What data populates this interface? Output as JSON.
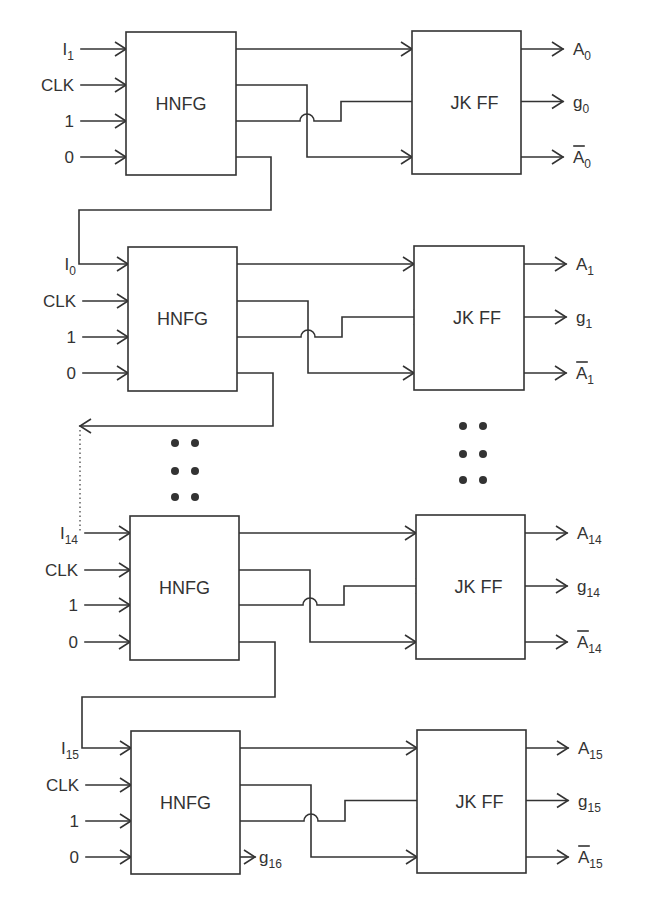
{
  "diagram": {
    "type": "block-diagram",
    "colors": {
      "line": "#333333",
      "text": "#333333",
      "background": "#ffffff"
    },
    "stages": [
      {
        "id": "stage-0",
        "hnfg": {
          "label": "HNFG",
          "x": 126,
          "y": 32,
          "w": 110,
          "h": 143
        },
        "jkff": {
          "label": "JK FF",
          "x": 412,
          "y": 31,
          "w": 109,
          "h": 143
        },
        "rows": [
          49,
          85,
          121,
          157
        ],
        "inputs": [
          {
            "main": "I",
            "sub": "1"
          },
          {
            "main": "CLK",
            "sub": ""
          },
          {
            "main": "1",
            "sub": ""
          },
          {
            "main": "0",
            "sub": ""
          }
        ],
        "outputs": [
          {
            "main": "A",
            "sub": "0",
            "bar": false
          },
          {
            "main": "g",
            "sub": "0",
            "bar": false
          },
          {
            "main": "A",
            "sub": "0",
            "bar": true
          }
        ],
        "first_input_wired": false,
        "fourth_output": "feedback"
      },
      {
        "id": "stage-1",
        "hnfg": {
          "label": "HNFG",
          "x": 128,
          "y": 247,
          "w": 109,
          "h": 144
        },
        "jkff": {
          "label": "JK FF",
          "x": 414,
          "y": 246,
          "w": 110,
          "h": 144
        },
        "rows": [
          264,
          301,
          337,
          373
        ],
        "inputs": [
          {
            "main": "I",
            "sub": "0"
          },
          {
            "main": "CLK",
            "sub": ""
          },
          {
            "main": "1",
            "sub": ""
          },
          {
            "main": "0",
            "sub": ""
          }
        ],
        "outputs": [
          {
            "main": "A",
            "sub": "1",
            "bar": false
          },
          {
            "main": "g",
            "sub": "1",
            "bar": false
          },
          {
            "main": "A",
            "sub": "1",
            "bar": true
          }
        ],
        "first_input_wired": true,
        "fourth_output": "feedback-arrow"
      },
      {
        "id": "stage-14",
        "hnfg": {
          "label": "HNFG",
          "x": 130,
          "y": 516,
          "w": 109,
          "h": 144
        },
        "jkff": {
          "label": "JK FF",
          "x": 416,
          "y": 515,
          "w": 109,
          "h": 144
        },
        "rows": [
          533,
          570,
          605,
          642
        ],
        "inputs": [
          {
            "main": "I",
            "sub": "14"
          },
          {
            "main": "CLK",
            "sub": ""
          },
          {
            "main": "1",
            "sub": ""
          },
          {
            "main": "0",
            "sub": ""
          }
        ],
        "outputs": [
          {
            "main": "A",
            "sub": "14",
            "bar": false
          },
          {
            "main": "g",
            "sub": "14",
            "bar": false
          },
          {
            "main": "A",
            "sub": "14",
            "bar": true
          }
        ],
        "first_input_wired": false,
        "fourth_output": "feedback"
      },
      {
        "id": "stage-15",
        "hnfg": {
          "label": "HNFG",
          "x": 131,
          "y": 731,
          "w": 109,
          "h": 143
        },
        "jkff": {
          "label": "JK FF",
          "x": 417,
          "y": 730,
          "w": 109,
          "h": 143
        },
        "rows": [
          748,
          785,
          821,
          857
        ],
        "inputs": [
          {
            "main": "I",
            "sub": "15"
          },
          {
            "main": "CLK",
            "sub": ""
          },
          {
            "main": "1",
            "sub": ""
          },
          {
            "main": "0",
            "sub": ""
          }
        ],
        "outputs": [
          {
            "main": "A",
            "sub": "15",
            "bar": false
          },
          {
            "main": "g",
            "sub": "15",
            "bar": false
          },
          {
            "main": "A",
            "sub": "15",
            "bar": true
          }
        ],
        "first_input_wired": true,
        "fourth_output": "terminal",
        "terminal_output": {
          "main": "g",
          "sub": "16"
        }
      }
    ],
    "feedback_wires": [
      {
        "from_stage": 0,
        "to_stage": 1,
        "points": [
          [
            236,
            157
          ],
          [
            271,
            157
          ],
          [
            271,
            210
          ],
          [
            79,
            210
          ],
          [
            79,
            264
          ],
          [
            128,
            264
          ]
        ]
      },
      {
        "from_stage": 1,
        "to": "ellipsis",
        "points": [
          [
            237,
            373
          ],
          [
            273,
            373
          ],
          [
            273,
            426
          ],
          [
            80,
            426
          ]
        ]
      },
      {
        "from_stage": 2,
        "to_stage": 3,
        "points": [
          [
            239,
            642
          ],
          [
            275,
            642
          ],
          [
            275,
            697
          ],
          [
            82,
            697
          ],
          [
            82,
            748
          ],
          [
            131,
            748
          ]
        ]
      }
    ],
    "dotted_link": {
      "x": 80,
      "y1": 430,
      "y2": 533
    },
    "ellipsis_left": {
      "cols": [
        175,
        195
      ],
      "rows": [
        443,
        471,
        497
      ]
    },
    "ellipsis_right": {
      "cols": [
        463,
        483
      ],
      "rows": [
        426,
        454,
        480
      ]
    }
  }
}
